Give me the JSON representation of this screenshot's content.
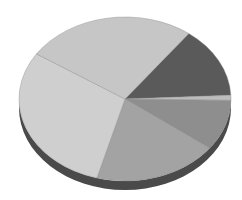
{
  "chart_data": {
    "type": "pie",
    "style": "3d",
    "title": "",
    "legend": [],
    "labels": [
      "Slice A",
      "Slice B",
      "Slice C",
      "Slice D",
      "Slice E",
      "Slice F"
    ],
    "values": [
      14,
      1,
      10,
      19,
      30,
      26
    ],
    "start_angle_deg": -53,
    "direction": "clockwise",
    "colors": [
      "#5a5a5a",
      "#bdbdbd",
      "#8e8e8e",
      "#a3a3a3",
      "#cfcfcf",
      "#c6c6c6"
    ],
    "side_color": "#4a4a4a",
    "geometry": {
      "cx": 125,
      "cy": 99,
      "rx": 106,
      "ry": 82,
      "depth": 9
    }
  }
}
